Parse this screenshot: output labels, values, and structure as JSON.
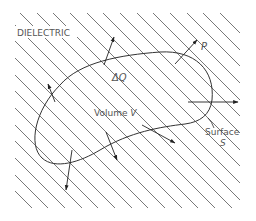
{
  "figure": {
    "region_label": "DIELECTRIC",
    "charge_element_label": "ΔQ",
    "volume_label": "Volume",
    "volume_symbol": "V",
    "surface_label": "Surface",
    "surface_symbol": "S",
    "polarization_label": "P"
  },
  "colors": {
    "background": "#ffffff",
    "hatch": "#555555",
    "outline": "#333333",
    "arrow": "#222222",
    "text": "#555555"
  }
}
